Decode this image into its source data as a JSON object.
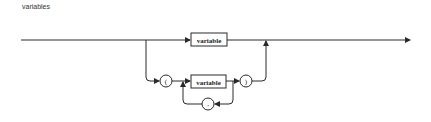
{
  "diagram": {
    "title": "variables",
    "nodes": {
      "top_variable": "variable",
      "open_paren": "(",
      "inner_variable": "variable",
      "close_paren": ")",
      "comma": ","
    },
    "colors": {
      "line": "#2a2a2a",
      "background": "#ffffff"
    }
  }
}
